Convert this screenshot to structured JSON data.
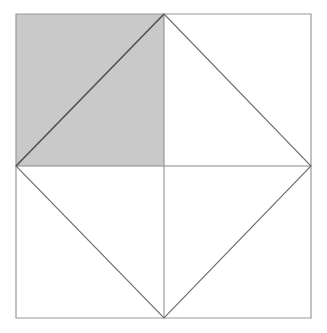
{
  "figure": {
    "canvas": {
      "width": 327,
      "height": 333,
      "background": "#ffffff"
    },
    "colors": {
      "shaded_fill": "#c9c9c9",
      "outer_border": "#9a9a9a",
      "diamond_stroke": "#6e6e6e",
      "median_stroke": "#8a8a8a",
      "shaded_diagonal_stroke": "#555555"
    },
    "stroke_widths": {
      "outer_border": 1.2,
      "diamond": 1.1,
      "median": 1.0,
      "shaded_diagonal": 1.4
    },
    "points": {
      "top_left": {
        "x": 16,
        "y": 14
      },
      "top_right": {
        "x": 311,
        "y": 14
      },
      "bottom_right": {
        "x": 311,
        "y": 318
      },
      "bottom_left": {
        "x": 16,
        "y": 318
      },
      "top_mid": {
        "x": 164,
        "y": 14
      },
      "right_mid": {
        "x": 311,
        "y": 166
      },
      "bottom_mid": {
        "x": 164,
        "y": 318
      },
      "left_mid": {
        "x": 16,
        "y": 166
      },
      "center": {
        "x": 164,
        "y": 166
      }
    },
    "shapes": {
      "outer_square": {
        "name": "outer-square",
        "points": "16,14 311,14 311,318 16,318"
      },
      "shaded_quadrant": {
        "name": "shaded-upper-left-quadrant",
        "points": "16,14 164,14 164,166 16,166",
        "fill": "#c9c9c9"
      },
      "inscribed_diamond": {
        "name": "inscribed-diamond",
        "points": "164,14 311,166 164,318 16,166"
      },
      "shaded_diagonal": {
        "name": "shaded-quadrant-diagonal",
        "x1": 16,
        "y1": 166,
        "x2": 164,
        "y2": 14
      },
      "vertical_median": {
        "name": "vertical-median",
        "x1": 164,
        "y1": 14,
        "x2": 164,
        "y2": 318
      },
      "horizontal_median": {
        "name": "horizontal-median",
        "x1": 16,
        "y1": 166,
        "x2": 311,
        "y2": 166
      }
    }
  }
}
